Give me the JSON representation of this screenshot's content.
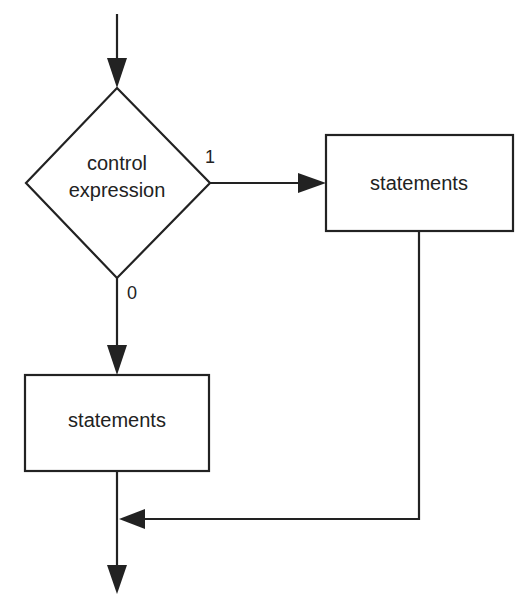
{
  "diagram": {
    "type": "flowchart",
    "colors": {
      "stroke": "#222222",
      "background": "#ffffff",
      "text": "#222222"
    },
    "nodes": {
      "decision": {
        "shape": "diamond",
        "lines": [
          "control",
          "expression"
        ]
      },
      "true_branch": {
        "shape": "rectangle",
        "label": "statements"
      },
      "false_branch": {
        "shape": "rectangle",
        "label": "statements"
      }
    },
    "edges": {
      "true_label": "1",
      "false_label": "0"
    }
  }
}
